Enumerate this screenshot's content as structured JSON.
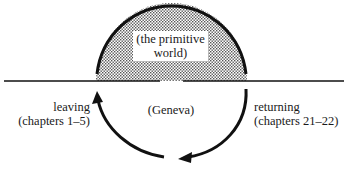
{
  "diagram": {
    "upper_region": {
      "line1": "(the primitive",
      "line2": "world)",
      "fill": "dotted"
    },
    "lower_region": {
      "label": "(Geneva)"
    },
    "left_arrow": {
      "line1": "leaving",
      "line2": "(chapters 1–5)"
    },
    "right_arrow": {
      "line1": "returning",
      "line2": "(chapters 21–22)"
    },
    "colors": {
      "stroke": "#111111",
      "dots": "#555555",
      "background": "#ffffff"
    }
  }
}
